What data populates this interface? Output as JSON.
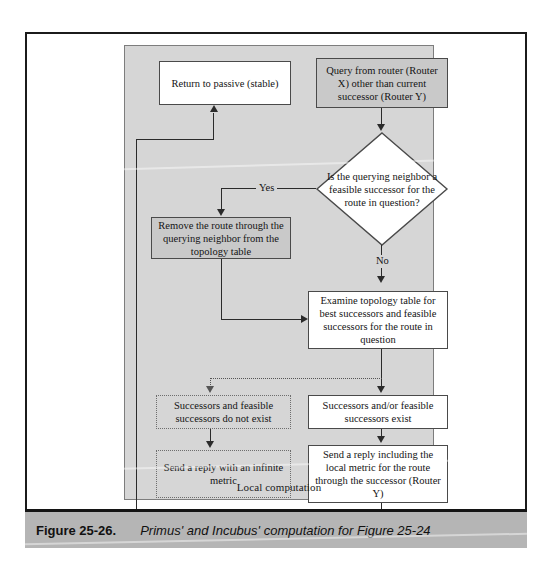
{
  "figure": {
    "container_label": "Local computation",
    "caption_number": "Figure 25-26.",
    "caption_text": "Primus' and Incubus' computation for Figure 25-24"
  },
  "nodes": {
    "return_to_passive": "Return to passive (stable)",
    "query_from_router": "Query from router (Router X) other than current successor (Router Y)",
    "decision": "Is the querying neighbor a feasible successor for the route in question?",
    "remove_route": "Remove the route through the querying neighbor from the topology table",
    "examine_topology": "Examine topology table for best successors and feasible successors for the route in question",
    "successors_not_exist": "Successors and feasible successors do not exist",
    "successors_exist": "Successors and/or feasible successors exist",
    "send_infinite_metric": "Send a reply with an infinite metric",
    "send_local_metric": "Send a reply including the local metric for the route through the successor (Router Y)"
  },
  "edge_labels": {
    "yes": "Yes",
    "no": "No"
  },
  "colors": {
    "container_fill": "#d6d6d6",
    "node_gray_fill": "#c9c9c9",
    "node_white_fill": "#ffffff",
    "stroke": "#4a4a4a",
    "connector": "#2b2b2b",
    "caption_band": "#b5b5b5"
  }
}
